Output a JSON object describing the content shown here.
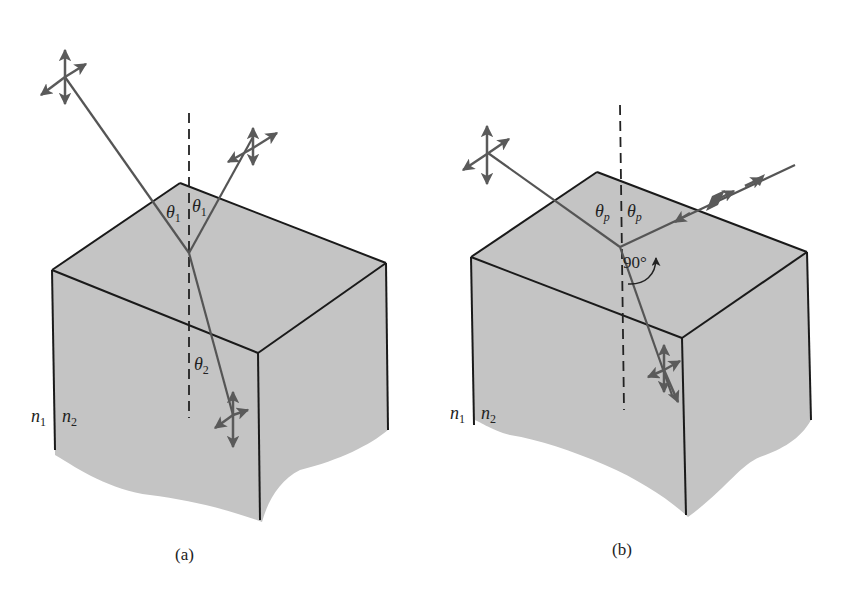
{
  "figure": {
    "panels": [
      {
        "id": "a",
        "caption": "(a)",
        "labels": {
          "incident_angle": "θ",
          "incident_angle_sub": "1",
          "reflected_angle": "θ",
          "reflected_angle_sub": "1",
          "refracted_angle": "θ",
          "refracted_angle_sub": "2",
          "n1": "n",
          "n1_sub": "1",
          "n2": "n",
          "n2_sub": "2"
        }
      },
      {
        "id": "b",
        "caption": "(b)",
        "labels": {
          "incident_angle": "θ",
          "incident_angle_sub": "p",
          "reflected_angle": "θ",
          "reflected_angle_sub": "p",
          "right_angle": "90°",
          "n1": "n",
          "n1_sub": "1",
          "n2": "n",
          "n2_sub": "2"
        }
      }
    ],
    "colors": {
      "block_fill": "#c4c4c4",
      "edge_stroke": "#1a1a1a",
      "ray_stroke": "#555555",
      "arrow_fill": "#5a5a5a",
      "background": "#ffffff"
    }
  }
}
